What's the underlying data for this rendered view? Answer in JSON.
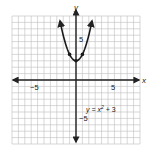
{
  "chart_data": {
    "type": "line",
    "title": "",
    "equation": "y = x² + 3",
    "xlabel": "x",
    "ylabel": "y",
    "xlim": [
      -10,
      10
    ],
    "ylim": [
      -10,
      10
    ],
    "grid": true,
    "tick_labels": {
      "x": [
        "−5",
        "5"
      ],
      "y": [
        "5",
        "−5"
      ]
    },
    "series": [
      {
        "name": "y = x² + 3",
        "x": [
          -2.5,
          -2,
          -1,
          0,
          1,
          2,
          2.5
        ],
        "y": [
          9.25,
          7,
          4,
          3,
          4,
          7,
          9.25
        ],
        "marked_points": [
          [
            -1,
            4
          ],
          [
            0,
            3
          ],
          [
            1,
            4
          ]
        ]
      }
    ]
  },
  "labels": {
    "x_axis": "x",
    "y_axis": "y",
    "x_neg5": "−5",
    "x_pos5": "5",
    "y_pos5": "5",
    "y_neg5": "−5",
    "eq_prefix": "y = x",
    "eq_exp": "2",
    "eq_suffix": " + 3"
  },
  "colors": {
    "grid": "#bdbdbd",
    "axis": "#222222",
    "curve": "#1a1a1a"
  }
}
